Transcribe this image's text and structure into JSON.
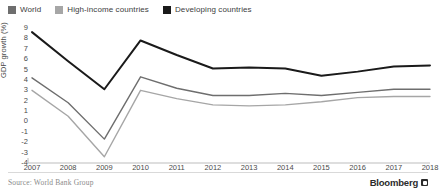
{
  "legend": {
    "items": [
      {
        "label": "World",
        "color": "#6e6e6e",
        "name": "world"
      },
      {
        "label": "High-income countries",
        "color": "#a6a6a6",
        "name": "high-income-countries"
      },
      {
        "label": "Developing countries",
        "color": "#1a1a1a",
        "name": "developing-countries"
      }
    ]
  },
  "footer": {
    "source": "Source: World Bank Group",
    "brand": "Bloomberg"
  },
  "chart_data": {
    "type": "line",
    "title": "",
    "xlabel": "",
    "ylabel": "GDP growth (%)",
    "categories": [
      "2007",
      "2008",
      "2009",
      "2010",
      "2011",
      "2012",
      "2013",
      "2014",
      "2015",
      "2016",
      "2017",
      "2018"
    ],
    "x": [
      2007,
      2008,
      2009,
      2010,
      2011,
      2012,
      2013,
      2014,
      2015,
      2016,
      2017,
      2018
    ],
    "ylim": [
      -4,
      9
    ],
    "yticks": [
      9,
      8,
      7,
      6,
      5,
      4,
      3,
      2,
      1,
      0,
      -1,
      -2,
      -3,
      -4
    ],
    "ytick_labels": [
      "9",
      "8",
      "7",
      "6",
      "5",
      "4",
      "3",
      "2",
      "1",
      "0",
      "-1",
      "-2",
      "-3",
      "-4"
    ],
    "grid": false,
    "legend_position": "top-left",
    "series": [
      {
        "name": "Developing countries",
        "color": "#1a1a1a",
        "values": [
          8.6,
          5.8,
          3.1,
          7.8,
          6.4,
          5.1,
          5.2,
          5.1,
          4.4,
          4.8,
          5.3,
          5.4
        ]
      },
      {
        "name": "World",
        "color": "#6e6e6e",
        "values": [
          4.2,
          1.8,
          -1.7,
          4.3,
          3.2,
          2.5,
          2.5,
          2.7,
          2.5,
          2.8,
          3.1,
          3.1
        ]
      },
      {
        "name": "High-income countries",
        "color": "#a6a6a6",
        "values": [
          3.0,
          0.5,
          -3.4,
          3.0,
          2.2,
          1.6,
          1.5,
          1.6,
          1.9,
          2.3,
          2.4,
          2.4
        ]
      }
    ]
  }
}
